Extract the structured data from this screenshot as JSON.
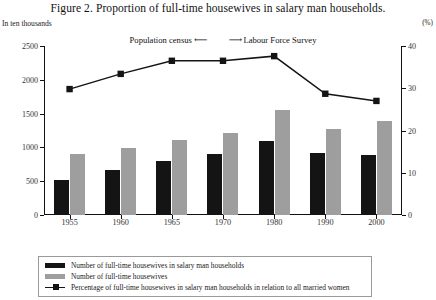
{
  "figure": {
    "title": "Figure 2.  Proportion of full-time housewives in salary man households.",
    "left_axis_unit": "In ten thousands",
    "right_axis_unit": "(%)",
    "annotation": {
      "left_text": "Population census",
      "left_arrow": "⟵",
      "right_arrow": "⟶",
      "right_text": "Labour Force Survey"
    }
  },
  "legend": {
    "items": [
      {
        "key": "black-swatch",
        "label": "Number of full-time housewives in salary man households"
      },
      {
        "key": "gray-swatch",
        "label": "Number of full-time housewives"
      },
      {
        "key": "line-marker",
        "label": "Percentage of full-time housewives in salary man households in relation to all married women"
      }
    ]
  },
  "colors": {
    "bar_black": "#141414",
    "bar_gray": "#9e9e9e",
    "line": "#141414",
    "axis": "#111111",
    "background": "#ffffff"
  },
  "chart_data": {
    "type": "bar",
    "title": "Figure 2.  Proportion of full-time housewives in salary man households.",
    "xlabel": "",
    "ylabel": "In ten thousands",
    "y2label": "(%)",
    "categories": [
      "1955",
      "1960",
      "1965",
      "1970",
      "1980",
      "1990",
      "2000"
    ],
    "ylim": [
      0,
      2500
    ],
    "yticks": [
      0,
      500,
      1000,
      1500,
      2000,
      2500
    ],
    "y2lim": [
      0,
      40
    ],
    "y2ticks": [
      0,
      10,
      20,
      30,
      40
    ],
    "grid": false,
    "legend_position": "bottom",
    "series": [
      {
        "name": "Number of full-time housewives in salary man households",
        "type": "bar",
        "axis": "left",
        "color": "#141414",
        "values": [
          520,
          660,
          800,
          900,
          1100,
          910,
          890
        ]
      },
      {
        "name": "Number of full-time housewives",
        "type": "bar",
        "axis": "left",
        "color": "#9e9e9e",
        "values": [
          900,
          990,
          1105,
          1220,
          1550,
          1270,
          1395
        ]
      },
      {
        "name": "Percentage of full-time housewives in salary man households in relation to all married women",
        "type": "line",
        "axis": "right",
        "color": "#141414",
        "marker": "square",
        "values": [
          29.8,
          33.4,
          36.5,
          36.5,
          37.6,
          28.7,
          27.0
        ]
      }
    ],
    "annotations": [
      {
        "text": "Population census  ⟵   ⟶  Labour Force Survey",
        "position": "above-line"
      }
    ]
  }
}
